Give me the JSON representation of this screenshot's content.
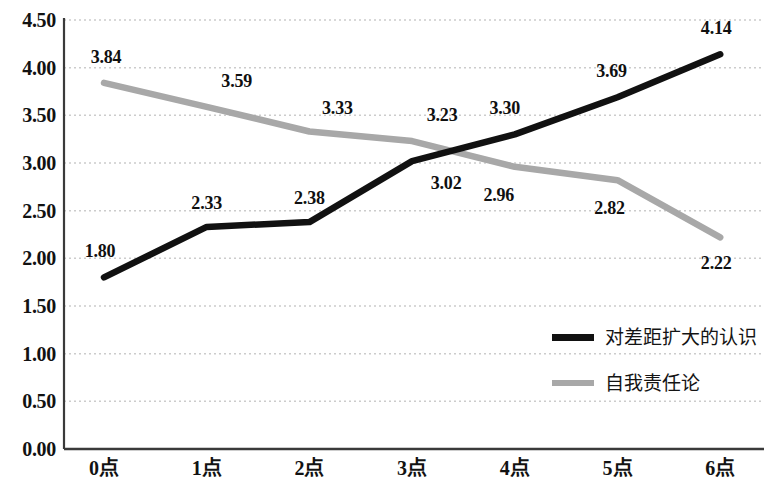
{
  "chart_data": {
    "type": "line",
    "title": "",
    "subtitle": "",
    "xlabel": "",
    "ylabel": "",
    "categories": [
      "0点",
      "1点",
      "2点",
      "3点",
      "4点",
      "5点",
      "6点"
    ],
    "ylim": [
      0.0,
      4.5
    ],
    "ytick_labels": [
      "0.00",
      "0.50",
      "1.00",
      "1.50",
      "2.00",
      "2.50",
      "3.00",
      "3.50",
      "4.00",
      "4.50"
    ],
    "ytick_values": [
      0.0,
      0.5,
      1.0,
      1.5,
      2.0,
      2.5,
      3.0,
      3.5,
      4.0,
      4.5
    ],
    "grid": true,
    "grid_style": "dotted",
    "legend_position": "inside-bottom-right",
    "series": [
      {
        "name": "对差距扩大的认识",
        "color": "#111111",
        "values": [
          1.8,
          2.33,
          2.38,
          3.02,
          3.3,
          3.69,
          4.14
        ],
        "labels": [
          "1.80",
          "2.33",
          "2.38",
          "3.02",
          "3.30",
          "3.69",
          "4.14"
        ]
      },
      {
        "name": "自我责任论",
        "color": "#a8a8a8",
        "values": [
          3.84,
          3.59,
          3.33,
          3.23,
          2.96,
          2.82,
          2.22
        ],
        "labels": [
          "3.84",
          "3.59",
          "3.33",
          "3.23",
          "2.96",
          "2.82",
          "2.22"
        ]
      }
    ]
  },
  "axis": {
    "y_labels": [
      {
        "text": "4.50",
        "value": 4.5
      },
      {
        "text": "4.00",
        "value": 4.0
      },
      {
        "text": "3.50",
        "value": 3.5
      },
      {
        "text": "3.00",
        "value": 3.0
      },
      {
        "text": "2.50",
        "value": 2.5
      },
      {
        "text": "2.00",
        "value": 2.0
      },
      {
        "text": "1.50",
        "value": 1.5
      },
      {
        "text": "1.00",
        "value": 1.0
      },
      {
        "text": "0.50",
        "value": 0.5
      },
      {
        "text": "0.00",
        "value": 0.0
      }
    ],
    "x_labels": [
      "0点",
      "1点",
      "2点",
      "3点",
      "4点",
      "5点",
      "6点"
    ]
  },
  "legend": {
    "items": [
      {
        "label": "对差距扩大的认识",
        "color": "#111111"
      },
      {
        "label": "自我责任论",
        "color": "#a8a8a8"
      }
    ]
  },
  "labels_black": [
    "1.80",
    "2.33",
    "2.38",
    "3.02",
    "3.30",
    "3.69",
    "4.14"
  ],
  "labels_gray": [
    "3.84",
    "3.59",
    "3.33",
    "3.23",
    "2.96",
    "2.82",
    "2.22"
  ],
  "colors": {
    "series_black": "#111111",
    "series_gray": "#a8a8a8",
    "axis": "#3a3a3a",
    "grid": "#cccccc",
    "text": "#121212",
    "background": "#ffffff"
  }
}
